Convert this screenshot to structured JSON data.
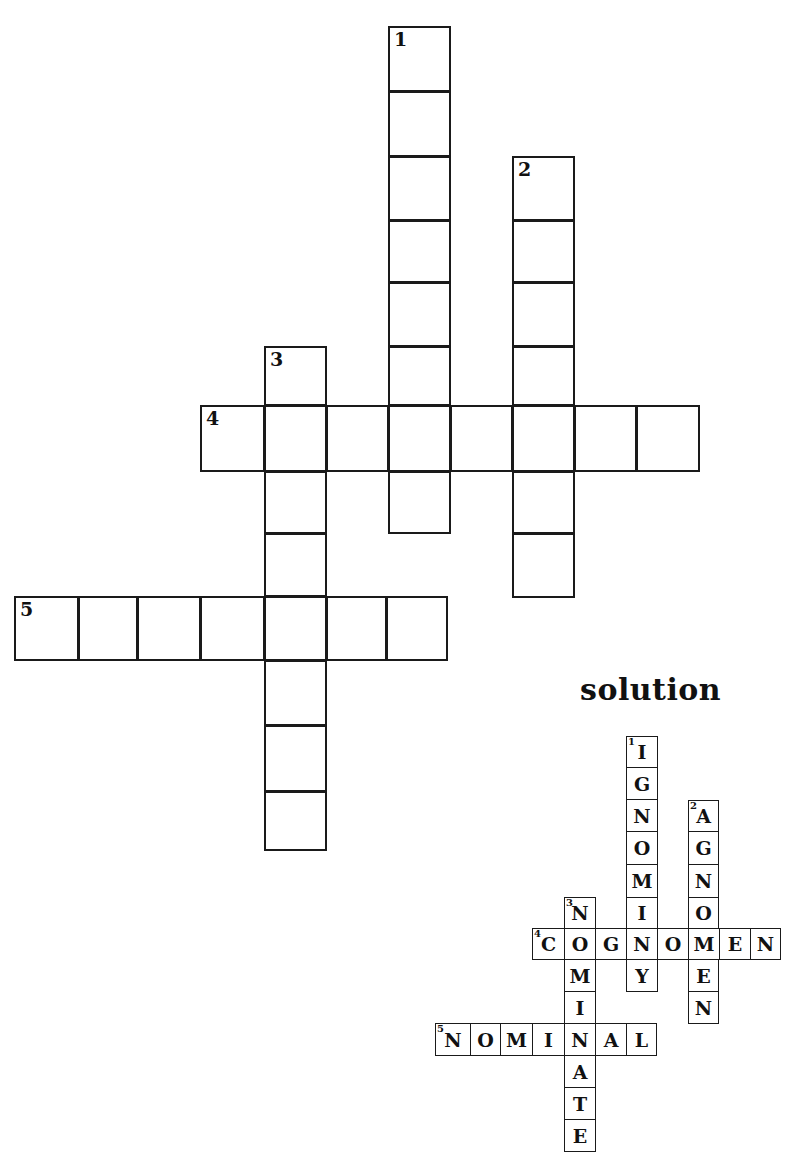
{
  "puzzle": {
    "clues": [
      {
        "number": "1",
        "direction": "down",
        "length": 8
      },
      {
        "number": "2",
        "direction": "down",
        "length": 7
      },
      {
        "number": "3",
        "direction": "down",
        "length": 8
      },
      {
        "number": "4",
        "direction": "across",
        "length": 8
      },
      {
        "number": "5",
        "direction": "across",
        "length": 7
      }
    ],
    "cells": [
      {
        "x": 388,
        "y": 26,
        "w": 63,
        "h": 66,
        "num": "1"
      },
      {
        "x": 388,
        "y": 91,
        "w": 63,
        "h": 66
      },
      {
        "x": 388,
        "y": 156,
        "w": 63,
        "h": 65
      },
      {
        "x": 388,
        "y": 220,
        "w": 63,
        "h": 63
      },
      {
        "x": 388,
        "y": 282,
        "w": 63,
        "h": 65
      },
      {
        "x": 388,
        "y": 346,
        "w": 63,
        "h": 60
      },
      {
        "x": 388,
        "y": 471,
        "w": 63,
        "h": 63
      },
      {
        "x": 512,
        "y": 156,
        "w": 63,
        "h": 65,
        "num": "2"
      },
      {
        "x": 512,
        "y": 220,
        "w": 63,
        "h": 63
      },
      {
        "x": 512,
        "y": 282,
        "w": 63,
        "h": 65
      },
      {
        "x": 512,
        "y": 346,
        "w": 63,
        "h": 60
      },
      {
        "x": 512,
        "y": 471,
        "w": 63,
        "h": 63
      },
      {
        "x": 512,
        "y": 533,
        "w": 63,
        "h": 65
      },
      {
        "x": 264,
        "y": 346,
        "w": 63,
        "h": 60,
        "num": "3"
      },
      {
        "x": 264,
        "y": 471,
        "w": 63,
        "h": 63
      },
      {
        "x": 264,
        "y": 533,
        "w": 63,
        "h": 64
      },
      {
        "x": 264,
        "y": 660,
        "w": 63,
        "h": 66
      },
      {
        "x": 264,
        "y": 725,
        "w": 63,
        "h": 67
      },
      {
        "x": 264,
        "y": 791,
        "w": 63,
        "h": 60
      },
      {
        "x": 200,
        "y": 405,
        "w": 65,
        "h": 67,
        "num": "4"
      },
      {
        "x": 264,
        "y": 405,
        "w": 63,
        "h": 67
      },
      {
        "x": 326,
        "y": 405,
        "w": 63,
        "h": 67
      },
      {
        "x": 388,
        "y": 405,
        "w": 63,
        "h": 67
      },
      {
        "x": 450,
        "y": 405,
        "w": 63,
        "h": 67
      },
      {
        "x": 512,
        "y": 405,
        "w": 63,
        "h": 67
      },
      {
        "x": 574,
        "y": 405,
        "w": 63,
        "h": 67
      },
      {
        "x": 636,
        "y": 405,
        "w": 64,
        "h": 67
      },
      {
        "x": 14,
        "y": 596,
        "w": 65,
        "h": 65,
        "num": "5"
      },
      {
        "x": 78,
        "y": 596,
        "w": 60,
        "h": 65
      },
      {
        "x": 137,
        "y": 596,
        "w": 64,
        "h": 65
      },
      {
        "x": 200,
        "y": 596,
        "w": 65,
        "h": 65
      },
      {
        "x": 264,
        "y": 596,
        "w": 63,
        "h": 65
      },
      {
        "x": 326,
        "y": 596,
        "w": 61,
        "h": 65
      },
      {
        "x": 386,
        "y": 596,
        "w": 62,
        "h": 65
      }
    ]
  },
  "solution": {
    "heading": "solution",
    "answers": {
      "1_down": "IGNOMINY",
      "2_down": "AGNOMEN",
      "3_down": "NOMINATE",
      "4_across": "COGNOMEN",
      "5_across": "NOMINAL"
    },
    "cells": [
      {
        "x": 626,
        "y": 736,
        "w": 32,
        "h": 32,
        "letter": "I",
        "num": "1"
      },
      {
        "x": 626,
        "y": 767,
        "w": 32,
        "h": 33,
        "letter": "G"
      },
      {
        "x": 626,
        "y": 799,
        "w": 32,
        "h": 33,
        "letter": "N"
      },
      {
        "x": 626,
        "y": 831,
        "w": 32,
        "h": 34,
        "letter": "O"
      },
      {
        "x": 626,
        "y": 864,
        "w": 32,
        "h": 34,
        "letter": "M"
      },
      {
        "x": 626,
        "y": 897,
        "w": 32,
        "h": 32,
        "letter": "I"
      },
      {
        "x": 626,
        "y": 959,
        "w": 32,
        "h": 33,
        "letter": "Y"
      },
      {
        "x": 688,
        "y": 800,
        "w": 31,
        "h": 32,
        "letter": "A",
        "num": "2"
      },
      {
        "x": 688,
        "y": 831,
        "w": 31,
        "h": 34,
        "letter": "G"
      },
      {
        "x": 688,
        "y": 864,
        "w": 31,
        "h": 34,
        "letter": "N"
      },
      {
        "x": 688,
        "y": 897,
        "w": 31,
        "h": 32,
        "letter": "O"
      },
      {
        "x": 688,
        "y": 959,
        "w": 31,
        "h": 33,
        "letter": "E"
      },
      {
        "x": 688,
        "y": 991,
        "w": 31,
        "h": 33,
        "letter": "N"
      },
      {
        "x": 564,
        "y": 897,
        "w": 32,
        "h": 32,
        "letter": "N",
        "num": "3"
      },
      {
        "x": 564,
        "y": 959,
        "w": 32,
        "h": 33,
        "letter": "M"
      },
      {
        "x": 564,
        "y": 991,
        "w": 32,
        "h": 33,
        "letter": "I"
      },
      {
        "x": 564,
        "y": 1055,
        "w": 32,
        "h": 33,
        "letter": "A"
      },
      {
        "x": 564,
        "y": 1087,
        "w": 32,
        "h": 33,
        "letter": "T"
      },
      {
        "x": 564,
        "y": 1119,
        "w": 32,
        "h": 33,
        "letter": "E"
      },
      {
        "x": 532,
        "y": 928,
        "w": 33,
        "h": 32,
        "letter": "C",
        "num": "4"
      },
      {
        "x": 564,
        "y": 928,
        "w": 32,
        "h": 32,
        "letter": "O"
      },
      {
        "x": 595,
        "y": 928,
        "w": 32,
        "h": 32,
        "letter": "G"
      },
      {
        "x": 626,
        "y": 928,
        "w": 32,
        "h": 32,
        "letter": "N"
      },
      {
        "x": 657,
        "y": 928,
        "w": 32,
        "h": 32,
        "letter": "O"
      },
      {
        "x": 688,
        "y": 928,
        "w": 32,
        "h": 32,
        "letter": "M"
      },
      {
        "x": 719,
        "y": 928,
        "w": 32,
        "h": 32,
        "letter": "E"
      },
      {
        "x": 750,
        "y": 928,
        "w": 31,
        "h": 32,
        "letter": "N"
      },
      {
        "x": 435,
        "y": 1023,
        "w": 36,
        "h": 33,
        "letter": "N",
        "num": "5"
      },
      {
        "x": 470,
        "y": 1023,
        "w": 31,
        "h": 33,
        "letter": "O"
      },
      {
        "x": 500,
        "y": 1023,
        "w": 33,
        "h": 33,
        "letter": "M"
      },
      {
        "x": 532,
        "y": 1023,
        "w": 33,
        "h": 33,
        "letter": "I"
      },
      {
        "x": 564,
        "y": 1023,
        "w": 32,
        "h": 33,
        "letter": "N"
      },
      {
        "x": 595,
        "y": 1023,
        "w": 32,
        "h": 33,
        "letter": "A"
      },
      {
        "x": 626,
        "y": 1023,
        "w": 31,
        "h": 33,
        "letter": "L"
      }
    ]
  }
}
